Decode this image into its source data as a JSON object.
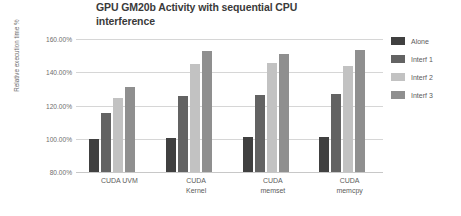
{
  "chart_data": {
    "type": "bar",
    "title": "GPU GM20b Activity with sequential CPU interference",
    "xlabel": "",
    "ylabel": "Relative execution time %",
    "categories": [
      "CUDA UVM",
      "CUDA Kernel",
      "CUDA memset",
      "CUDA memcpy"
    ],
    "category_lines": [
      [
        "CUDA UVM"
      ],
      [
        "CUDA",
        "Kernel"
      ],
      [
        "CUDA",
        "memset"
      ],
      [
        "CUDA",
        "memcpy"
      ]
    ],
    "series": [
      {
        "name": "Alone",
        "color": "#404040",
        "values": [
          100.0,
          100.5,
          101.0,
          101.2
        ]
      },
      {
        "name": "Interf 1",
        "color": "#636363",
        "values": [
          115.5,
          126.0,
          126.5,
          126.8
        ]
      },
      {
        "name": "Interf 2",
        "color": "#c2c2c2",
        "values": [
          124.8,
          145.2,
          145.4,
          143.6
        ]
      },
      {
        "name": "Interf 3",
        "color": "#8f8f8f",
        "values": [
          131.2,
          152.6,
          151.2,
          153.6
        ]
      }
    ],
    "ylim": [
      80,
      160
    ],
    "ytick_values": [
      80,
      100,
      120,
      140,
      160
    ],
    "ytick_labels": [
      "80.00%",
      "100.00%",
      "120.00%",
      "140.00%",
      "160.00%"
    ],
    "grid": true,
    "legend_position": "right"
  }
}
